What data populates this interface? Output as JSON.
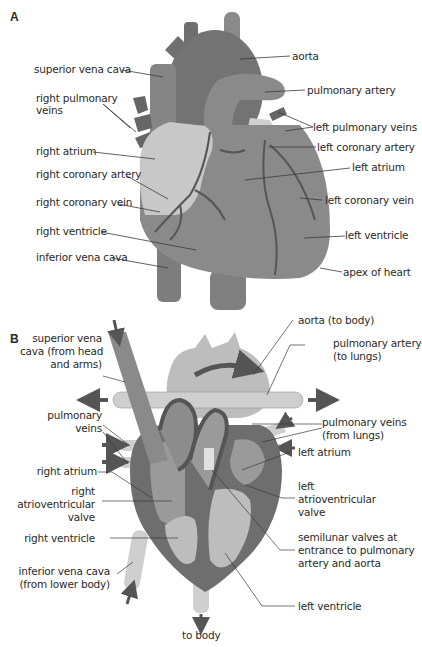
{
  "figure": {
    "panels": [
      {
        "id": "A",
        "letter": "A",
        "view": "external anterior view of heart",
        "labels": {
          "superior_vena_cava": "superior vena cava",
          "right_pulmonary_veins_1": "right pulmonary",
          "right_pulmonary_veins_2": "veins",
          "right_atrium": "right atrium",
          "right_coronary_artery": "right coronary artery",
          "right_coronary_vein": "right coronary vein",
          "right_ventricle": "right ventricle",
          "inferior_vena_cava": "inferior vena cava",
          "aorta": "aorta",
          "pulmonary_artery": "pulmonary artery",
          "left_pulmonary_veins": "left pulmonary veins",
          "left_coronary_artery": "left coronary artery",
          "left_atrium": "left atrium",
          "left_coronary_vein": "left coronary vein",
          "left_ventricle": "left ventricle",
          "apex_of_heart": "apex of heart"
        }
      },
      {
        "id": "B",
        "letter": "B",
        "view": "cross-section showing blood flow",
        "labels": {
          "svc_1": "superior vena",
          "svc_2": "cava (from head",
          "svc_3": "and arms)",
          "pulm_veins_l_1": "pulmonary",
          "pulm_veins_l_2": "veins",
          "right_atrium": "right atrium",
          "rav_1": "right",
          "rav_2": "atrioventricular",
          "rav_3": "valve",
          "right_ventricle": "right ventricle",
          "ivc_1": "inferior vena cava",
          "ivc_2": "(from lower body)",
          "aorta": "aorta (to body)",
          "pa_1": "pulmonary artery",
          "pa_2": "(to lungs)",
          "pv_1": "pulmonary veins",
          "pv_2": "(from lungs)",
          "left_atrium": "left atrium",
          "lav_1": "left",
          "lav_2": "atrioventricular",
          "lav_3": "valve",
          "sv_1": "semilunar valves at",
          "sv_2": "entrance to pulmonary",
          "sv_3": "artery and aorta",
          "left_ventricle": "left ventricle",
          "to_body": "to body"
        }
      }
    ],
    "colors": {
      "dark": "#6e6e6e",
      "mid": "#8c8c8c",
      "light": "#bdbdbd",
      "pale": "#d9d9d9",
      "line": "#3a3a3a",
      "arrow": "#555555"
    }
  }
}
